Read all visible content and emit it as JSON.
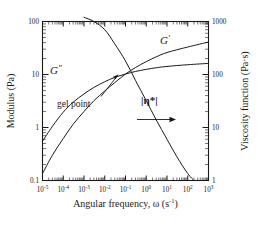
{
  "chart_data": {
    "type": "line",
    "title": "",
    "subtitle": "",
    "xlabel": "Angular frequency, ω (s⁻¹)",
    "xlabel_parts": {
      "text": "Angular frequency, ω (s",
      "exp": "-1",
      "tail": ")"
    },
    "ylabel": "Modulus (Pa)",
    "ylabel_right": "Viscosity function (Pa·s)",
    "xscale": "log",
    "yscale": "log",
    "xlim": [
      1e-05,
      1000
    ],
    "ylim": [
      0.1,
      100
    ],
    "ylim_right": [
      1,
      1000
    ],
    "grid": false,
    "legend": "inline-curve-labels",
    "xticks": [
      {
        "value": 1e-05,
        "mantissa": "10",
        "exp": "-5"
      },
      {
        "value": 0.0001,
        "mantissa": "10",
        "exp": "-4"
      },
      {
        "value": 0.001,
        "mantissa": "10",
        "exp": "-3"
      },
      {
        "value": 0.01,
        "mantissa": "10",
        "exp": "-2"
      },
      {
        "value": 0.1,
        "mantissa": "10",
        "exp": "-1"
      },
      {
        "value": 1,
        "mantissa": "10",
        "exp": "0"
      },
      {
        "value": 10,
        "mantissa": "10",
        "exp": "1"
      },
      {
        "value": 100,
        "mantissa": "10",
        "exp": "2"
      },
      {
        "value": 1000,
        "mantissa": "10",
        "exp": "3"
      }
    ],
    "yticks_left": [
      {
        "value": 0.1,
        "label": "0.1"
      },
      {
        "value": 1,
        "label": "1"
      },
      {
        "value": 10,
        "label": "10"
      },
      {
        "value": 100,
        "label": "100"
      }
    ],
    "yticks_right": [
      {
        "value": 1,
        "label": "1"
      },
      {
        "value": 10,
        "label": "10"
      },
      {
        "value": 100,
        "label": "100"
      },
      {
        "value": 1000,
        "label": "1000"
      }
    ],
    "series": [
      {
        "name": "G'",
        "label": "G′",
        "label_base": "G",
        "label_prime": "′",
        "axis": "left",
        "description": "Storage modulus; rises steeply at low frequency then flattens",
        "points": [
          [
            1e-05,
            0.135
          ],
          [
            3e-05,
            0.3
          ],
          [
            0.0001,
            0.62
          ],
          [
            0.0003,
            1.15
          ],
          [
            0.001,
            2.0
          ],
          [
            0.003,
            3.2
          ],
          [
            0.01,
            4.9
          ],
          [
            0.03,
            7.0
          ],
          [
            0.1,
            10.2
          ],
          [
            0.3,
            13.5
          ],
          [
            1,
            17.5
          ],
          [
            3,
            21.5
          ],
          [
            10,
            26.0
          ],
          [
            100,
            33.0
          ],
          [
            1000,
            41.0
          ]
        ]
      },
      {
        "name": "G''",
        "label": "G″",
        "label_base": "G",
        "label_prime": "″",
        "axis": "left",
        "description": "Loss modulus; starts higher than G' at low frequency, crosses G' at the gel point, then plateaus lower",
        "points": [
          [
            1e-05,
            0.55
          ],
          [
            3e-05,
            1.05
          ],
          [
            0.0001,
            1.95
          ],
          [
            0.0003,
            3.0
          ],
          [
            0.001,
            4.3
          ],
          [
            0.003,
            5.7
          ],
          [
            0.01,
            7.3
          ],
          [
            0.03,
            8.8
          ],
          [
            0.1,
            10.2
          ],
          [
            0.3,
            11.4
          ],
          [
            1,
            12.5
          ],
          [
            3,
            13.4
          ],
          [
            10,
            14.2
          ],
          [
            100,
            15.3
          ],
          [
            1000,
            16.2
          ]
        ]
      },
      {
        "name": "|eta*|",
        "label": "|η*|",
        "axis": "right",
        "description": "Complex viscosity magnitude; decreases monotonically with frequency, read on right axis",
        "points": [
          [
            0.001,
            1200
          ],
          [
            0.003,
            1000
          ],
          [
            0.01,
            700
          ],
          [
            0.03,
            380
          ],
          [
            0.1,
            180
          ],
          [
            0.3,
            78
          ],
          [
            1,
            32
          ],
          [
            3,
            14
          ],
          [
            10,
            6.0
          ],
          [
            30,
            2.8
          ],
          [
            100,
            1.35
          ],
          [
            200,
            1.0
          ]
        ]
      }
    ],
    "annotations": [
      {
        "name": "gel-point",
        "text": "gel point",
        "target_x": 0.06,
        "target_y": 10.2,
        "description": "Arrow pointing to the crossover of G' and G''"
      },
      {
        "name": "right-axis-arrow",
        "text": "",
        "description": "Horizontal arrow under |η*| indicating it is read on the right-hand axis"
      }
    ],
    "colors": {
      "curve": "#1a1a1a",
      "axis": "#1a1a1a",
      "background": "#ffffff",
      "text": "#1a1a1a"
    }
  }
}
